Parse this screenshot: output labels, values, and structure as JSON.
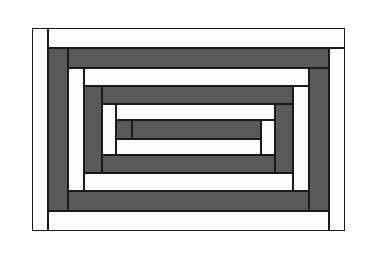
{
  "figure": {
    "kind": "log-cabin-quilt-block-diagram",
    "background_color": "#ffffff",
    "outline_color": "#1a1a1a",
    "light_fabric_color": "#fdfdfb",
    "dark_fabric_color": "#595959",
    "outline_width_px": 1,
    "canvas": {
      "width": 365,
      "height": 254
    }
  },
  "block": {
    "frame": {
      "x": 32,
      "y": 28,
      "w": 313,
      "h": 203
    },
    "ring_count": 5,
    "log_count": 20,
    "spiral_order": "counter-clockwise from outer left"
  },
  "logs": [
    {
      "name": "log-01-left-light",
      "shade": "light",
      "x": 32,
      "y": 28,
      "w": 16,
      "h": 203
    },
    {
      "name": "log-02-top-light",
      "shade": "light",
      "x": 48,
      "y": 28,
      "w": 297,
      "h": 20
    },
    {
      "name": "log-03-right-light",
      "shade": "light",
      "x": 329,
      "y": 48,
      "w": 16,
      "h": 183
    },
    {
      "name": "log-04-bottom-light",
      "shade": "light",
      "x": 48,
      "y": 211,
      "w": 281,
      "h": 20
    },
    {
      "name": "log-05-left-dark",
      "shade": "dark",
      "x": 48,
      "y": 48,
      "w": 20,
      "h": 163
    },
    {
      "name": "log-06-top-dark",
      "shade": "dark",
      "x": 68,
      "y": 48,
      "w": 261,
      "h": 20
    },
    {
      "name": "log-07-right-dark",
      "shade": "dark",
      "x": 309,
      "y": 68,
      "w": 20,
      "h": 143
    },
    {
      "name": "log-08-bottom-dark",
      "shade": "dark",
      "x": 68,
      "y": 191,
      "w": 241,
      "h": 20
    },
    {
      "name": "log-09-left-light",
      "shade": "light",
      "x": 68,
      "y": 68,
      "w": 16,
      "h": 123
    },
    {
      "name": "log-10-top-light",
      "shade": "light",
      "x": 84,
      "y": 68,
      "w": 225,
      "h": 18
    },
    {
      "name": "log-11-right-light",
      "shade": "light",
      "x": 293,
      "y": 86,
      "w": 16,
      "h": 105
    },
    {
      "name": "log-12-bottom-light",
      "shade": "light",
      "x": 84,
      "y": 173,
      "w": 209,
      "h": 18
    },
    {
      "name": "log-13-left-dark",
      "shade": "dark",
      "x": 84,
      "y": 86,
      "w": 18,
      "h": 87
    },
    {
      "name": "log-14-top-dark",
      "shade": "dark",
      "x": 102,
      "y": 86,
      "w": 191,
      "h": 18
    },
    {
      "name": "log-15-right-dark",
      "shade": "dark",
      "x": 275,
      "y": 104,
      "w": 18,
      "h": 69
    },
    {
      "name": "log-16-bottom-dark",
      "shade": "dark",
      "x": 102,
      "y": 155,
      "w": 173,
      "h": 18
    },
    {
      "name": "log-17-left-light",
      "shade": "light",
      "x": 102,
      "y": 104,
      "w": 14,
      "h": 51
    },
    {
      "name": "log-18-top-light",
      "shade": "light",
      "x": 116,
      "y": 104,
      "w": 159,
      "h": 16
    },
    {
      "name": "log-19-right-light",
      "shade": "light",
      "x": 261,
      "y": 120,
      "w": 14,
      "h": 35
    },
    {
      "name": "log-20-bottom-light",
      "shade": "light",
      "x": 116,
      "y": 139,
      "w": 145,
      "h": 16
    },
    {
      "name": "log-21-left-dark",
      "shade": "dark",
      "x": 116,
      "y": 120,
      "w": 16,
      "h": 19
    },
    {
      "name": "log-22-center-dark",
      "shade": "dark",
      "x": 132,
      "y": 120,
      "w": 129,
      "h": 19
    }
  ]
}
